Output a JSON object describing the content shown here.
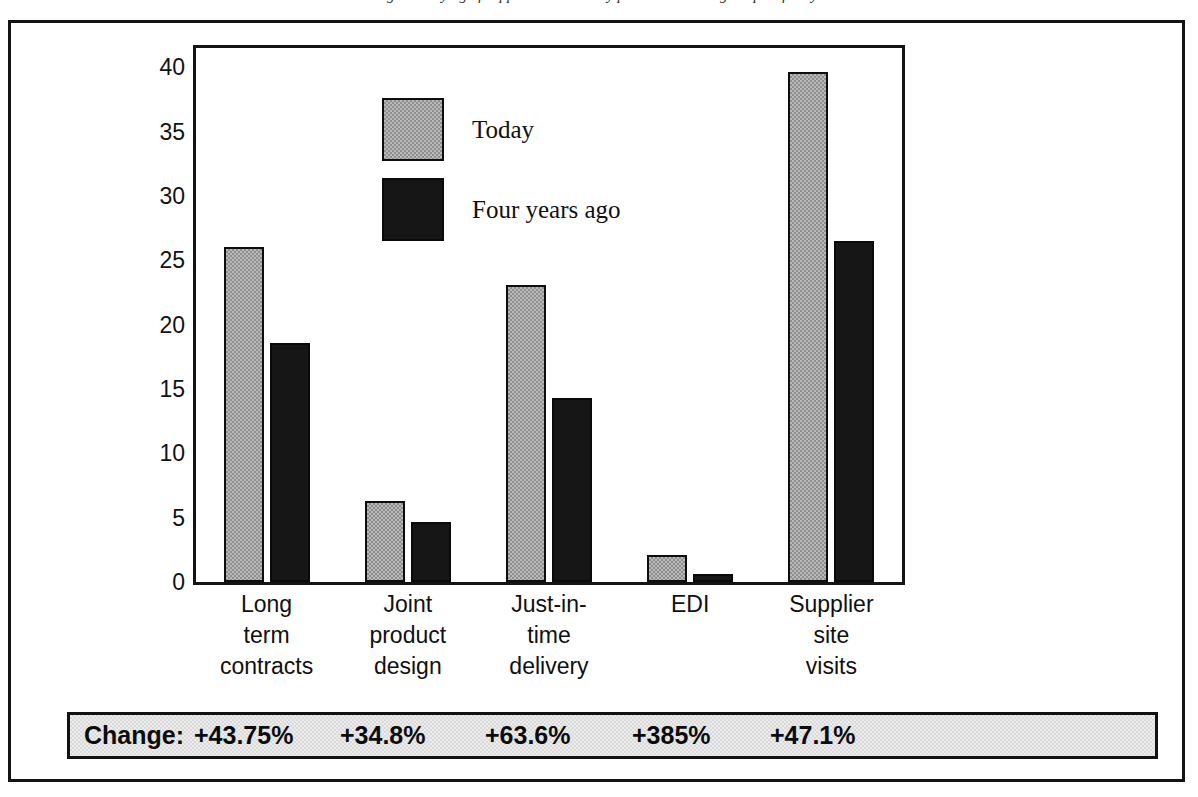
{
  "caption": {
    "text": "Changes in buying of supplies and delivery procedures during the past four years"
  },
  "legend": {
    "position": "inside-top-left",
    "items": [
      {
        "label": "Today",
        "swatch": "light-gray-dither"
      },
      {
        "label": "Four years ago",
        "swatch": "black"
      }
    ]
  },
  "change_row": {
    "title": "Change:",
    "values": [
      "+43.75%",
      "+34.8%",
      "+63.6%",
      "+385%",
      "+47.1%"
    ]
  },
  "chart_data": {
    "type": "bar",
    "title": "",
    "subtitle": "",
    "xlabel": "",
    "ylabel": "",
    "ylim": [
      0,
      41.5
    ],
    "yticks": [
      0,
      5,
      10,
      15,
      20,
      25,
      30,
      35,
      40
    ],
    "ytick_labels": [
      "0",
      "5",
      "10",
      "15",
      "20",
      "25",
      "30",
      "35",
      "40"
    ],
    "grid": false,
    "legend_position": "upper-left-inside",
    "categories": [
      "Long\nterm\ncontracts",
      "Joint\nproduct\ndesign",
      "Just-in-\ntime\ndelivery",
      "EDI",
      "Supplier\nsite\nvisits"
    ],
    "category_lines": [
      [
        "Long",
        "term",
        "contracts"
      ],
      [
        "Joint",
        "product",
        "design"
      ],
      [
        "Just-in-",
        "time",
        "delivery"
      ],
      [
        "EDI",
        "",
        ""
      ],
      [
        "Supplier",
        "site",
        "visits"
      ]
    ],
    "series": [
      {
        "name": "Today",
        "color": "#b9b9b9",
        "values": [
          26.0,
          6.3,
          23.1,
          2.1,
          39.6
        ]
      },
      {
        "name": "Four years ago",
        "color": "#161616",
        "values": [
          18.6,
          4.7,
          14.3,
          0.6,
          26.5
        ]
      }
    ],
    "annotations": {
      "change": [
        "+43.75%",
        "+34.8%",
        "+63.6%",
        "+385%",
        "+47.1%"
      ]
    }
  }
}
